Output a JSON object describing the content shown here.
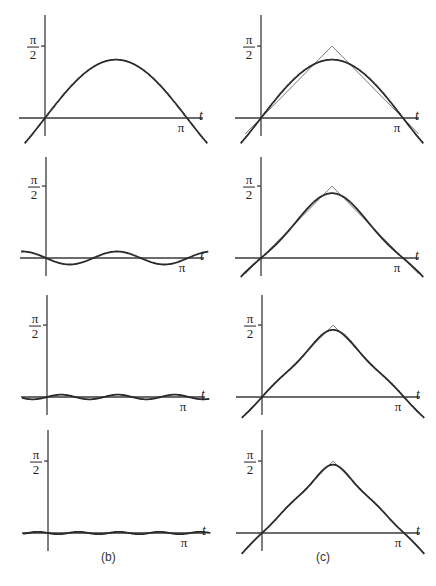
{
  "captions": {
    "left": "(b)",
    "right": "(c)"
  },
  "labels": {
    "y_tick": "π/2",
    "y_tick_num": "π",
    "y_tick_den": "2",
    "x_tick": "π",
    "x_axis": "t"
  },
  "colors": {
    "curve": "#2a2a2a",
    "triangle": "#6a6a6a",
    "axis": "#3a3a3a"
  },
  "chart_data": [
    {
      "type": "line",
      "panel": "b1",
      "title": "",
      "xlabel": "t",
      "ylabel": "",
      "x_ticks": [
        "π"
      ],
      "y_ticks": [
        "π/2"
      ],
      "xlim": [
        -0.4,
        3.5
      ],
      "ylim": [
        -0.4,
        1.9
      ],
      "series": [
        {
          "name": "(4/π) sin t",
          "coeffs": [
            [
              1,
              1.2732
            ]
          ]
        }
      ]
    },
    {
      "type": "line",
      "panel": "b2",
      "xlabel": "t",
      "x_ticks": [
        "π"
      ],
      "y_ticks": [
        "π/2"
      ],
      "series": [
        {
          "name": "-(4/9π) sin 3t",
          "coeffs": [
            [
              3,
              -0.1415
            ]
          ]
        }
      ]
    },
    {
      "type": "line",
      "panel": "b3",
      "xlabel": "t",
      "x_ticks": [
        "π"
      ],
      "y_ticks": [
        "π/2"
      ],
      "series": [
        {
          "name": "(4/25π) sin 5t",
          "coeffs": [
            [
              5,
              0.0509
            ]
          ]
        }
      ]
    },
    {
      "type": "line",
      "panel": "b4",
      "xlabel": "t",
      "x_ticks": [
        "π"
      ],
      "y_ticks": [
        "π/2"
      ],
      "series": [
        {
          "name": "-(4/49π) sin 7t",
          "coeffs": [
            [
              7,
              -0.026
            ]
          ]
        }
      ]
    },
    {
      "type": "line",
      "panel": "c1",
      "xlabel": "t",
      "x_ticks": [
        "π"
      ],
      "y_ticks": [
        "π/2"
      ],
      "series": [
        {
          "name": "triangle wave",
          "points": [
            [
              -0.35,
              -0.35
            ],
            [
              1.5708,
              1.5708
            ],
            [
              3.49,
              -0.35
            ]
          ]
        },
        {
          "name": "partial sum S1",
          "coeffs": [
            [
              1,
              1.2732
            ]
          ]
        }
      ]
    },
    {
      "type": "line",
      "panel": "c2",
      "xlabel": "t",
      "x_ticks": [
        "π"
      ],
      "y_ticks": [
        "π/2"
      ],
      "series": [
        {
          "name": "triangle wave",
          "points": [
            [
              -0.35,
              -0.35
            ],
            [
              1.5708,
              1.5708
            ],
            [
              3.49,
              -0.35
            ]
          ]
        },
        {
          "name": "partial sum S2",
          "coeffs": [
            [
              1,
              1.2732
            ],
            [
              3,
              -0.1415
            ]
          ]
        }
      ]
    },
    {
      "type": "line",
      "panel": "c3",
      "xlabel": "t",
      "x_ticks": [
        "π"
      ],
      "y_ticks": [
        "π/2"
      ],
      "series": [
        {
          "name": "triangle wave",
          "points": [
            [
              -0.35,
              -0.35
            ],
            [
              1.5708,
              1.5708
            ],
            [
              3.49,
              -0.35
            ]
          ]
        },
        {
          "name": "partial sum S3",
          "coeffs": [
            [
              1,
              1.2732
            ],
            [
              3,
              -0.1415
            ],
            [
              5,
              0.0509
            ]
          ]
        }
      ]
    },
    {
      "type": "line",
      "panel": "c4",
      "xlabel": "t",
      "x_ticks": [
        "π"
      ],
      "y_ticks": [
        "π/2"
      ],
      "series": [
        {
          "name": "triangle wave",
          "points": [
            [
              -0.35,
              -0.35
            ],
            [
              1.5708,
              1.5708
            ],
            [
              3.49,
              -0.35
            ]
          ]
        },
        {
          "name": "partial sum S4",
          "coeffs": [
            [
              1,
              1.2732
            ],
            [
              3,
              -0.1415
            ],
            [
              5,
              0.0509
            ],
            [
              7,
              -0.026
            ]
          ]
        }
      ]
    }
  ]
}
